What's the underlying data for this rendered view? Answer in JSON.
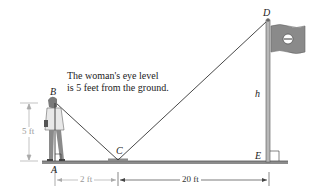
{
  "annotation": {
    "line1": "The woman's eye level",
    "line2": "is 5 feet from the ground."
  },
  "points": {
    "A": "A",
    "B": "B",
    "C": "C",
    "D": "D",
    "E": "E"
  },
  "labels": {
    "height_var": "h",
    "eye_height": "5 ft",
    "dist_AC": "2 ft",
    "dist_CE": "20 ft"
  },
  "colors": {
    "line": "#333333",
    "ground": "#777777",
    "flag": "#8a8a8a",
    "pole": "#9a9a9a",
    "dim_light": "#aaaaaa"
  }
}
